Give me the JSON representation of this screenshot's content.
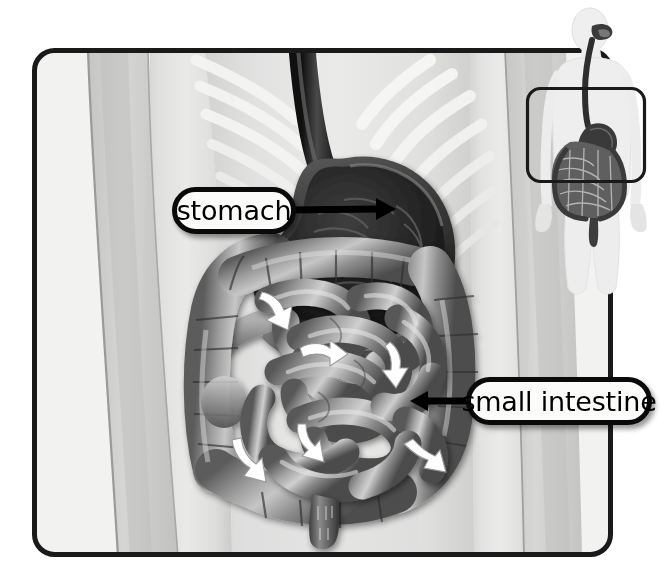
{
  "illustration": {
    "title": "Human digestive system — abdominal cutaway",
    "frame": {
      "name": "main-illustration-frame",
      "x": 32,
      "y": 48,
      "width": 581,
      "height": 509,
      "corner_radius": 22,
      "stroke_color": "#1a1a1a",
      "stroke_width": 5,
      "fill_color": "#f2f2f0"
    },
    "background_body": {
      "name": "body-silhouette-background",
      "description": "translucent gray human torso, arms and ribcage",
      "torso_color": "#d8d8d6",
      "arm_color": "#c9c9c7",
      "rib_color": "#eeeeec"
    },
    "organs": [
      {
        "id": "esophagus",
        "name": "esophagus",
        "color": "#3a3a3a",
        "description": "dark tube descending from top of frame into stomach"
      },
      {
        "id": "stomach",
        "name": "stomach",
        "color": "#2b2b2b",
        "interior_color": "#1e1e1e",
        "description": "cutaway stomach showing dark interior with rugae folds"
      },
      {
        "id": "large-intestine",
        "name": "large intestine (colon)",
        "color": "#8e8e8e",
        "description": "segmented haustra forming frame around small intestine"
      },
      {
        "id": "small-intestine",
        "name": "small intestine",
        "color": "#9a9a9a",
        "description": "coiled loops filling center of abdomen"
      },
      {
        "id": "rectum",
        "name": "rectum",
        "color": "#6f6f6f",
        "description": "short descending tube at bottom center"
      }
    ],
    "flow_arrows": {
      "name": "digestion-flow-arrows",
      "color": "#ffffff",
      "count": 5,
      "description": "white curved arrows indicating direction of food movement"
    }
  },
  "labels": [
    {
      "id": "stomach",
      "text": "stomach",
      "box": {
        "x": 172,
        "y": 187,
        "width": 124,
        "height": 47
      },
      "connector": {
        "name": "stomach-connector-arrow",
        "from_x": 296,
        "from_y": 210,
        "to_x": 392,
        "to_y": 209,
        "arrow_direction": "right",
        "color": "#000000"
      }
    },
    {
      "id": "small-intestine",
      "text": "small intestine",
      "box": {
        "x": 466,
        "y": 377,
        "width": 186,
        "height": 48
      },
      "connector": {
        "name": "small-intestine-connector-arrow",
        "from_x": 466,
        "from_y": 401,
        "to_x": 412,
        "to_y": 401,
        "arrow_direction": "left",
        "color": "#000000"
      }
    }
  ],
  "inset": {
    "name": "body-orientation-inset",
    "x": 508,
    "y": 0,
    "width": 164,
    "height": 300,
    "description": "full-body figure showing location of abdominal region",
    "body_color": "#ececec",
    "tract_color": "#2e2e2e",
    "highlight_frame": {
      "name": "inset-region-highlight",
      "x": 527,
      "y": 88,
      "width": 118,
      "height": 94,
      "corner_radius": 14,
      "stroke_color": "#1a1a1a",
      "stroke_width": 3
    }
  },
  "colors": {
    "page_background": "#ffffff",
    "frame_fill": "#f2f2f0",
    "label_fill": "#fbfbfa",
    "label_border": "#0a0a0a",
    "label_text": "#000000",
    "arrow_white": "#ffffff"
  }
}
